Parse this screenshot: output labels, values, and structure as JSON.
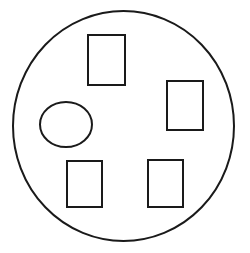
{
  "figure": {
    "canvas": {
      "width": 250,
      "height": 253
    },
    "background_color": "#ffffff",
    "stroke_color": "#1a1a1a",
    "fill_color": "#ffffff",
    "shape_count": 6,
    "container": {
      "name": "outer-circle",
      "type": "ellipse",
      "cx": 123.5,
      "cy": 126,
      "rx": 110.5,
      "ry": 115,
      "stroke_width": 2
    },
    "shapes": [
      {
        "name": "rectangle-top",
        "type": "rectangle",
        "position": "top-center",
        "x": 88,
        "y": 35,
        "width": 37,
        "height": 50,
        "stroke_width": 2
      },
      {
        "name": "rectangle-right",
        "type": "rectangle",
        "position": "middle-right",
        "x": 167,
        "y": 81,
        "width": 36,
        "height": 49,
        "stroke_width": 2
      },
      {
        "name": "ellipse-left",
        "type": "ellipse",
        "position": "middle-left",
        "cx": 66,
        "cy": 124.5,
        "rx": 26,
        "ry": 22.5,
        "stroke_width": 2
      },
      {
        "name": "rectangle-bottom-left",
        "type": "rectangle",
        "position": "bottom-left",
        "x": 67,
        "y": 161,
        "width": 35,
        "height": 46,
        "stroke_width": 2
      },
      {
        "name": "rectangle-bottom-right",
        "type": "rectangle",
        "position": "bottom-right",
        "x": 148,
        "y": 160,
        "width": 35,
        "height": 47,
        "stroke_width": 2
      }
    ]
  }
}
